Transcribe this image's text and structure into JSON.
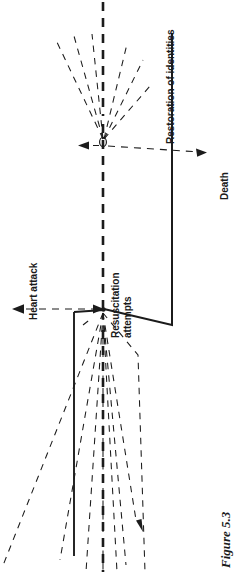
{
  "figure": {
    "caption": "Figure 5.3",
    "colors": {
      "ink": "#1b1b1b",
      "background": "#ffffff"
    },
    "orientation": "rotated-90-ccw"
  },
  "labels": {
    "heart_attack": "Heart attack",
    "resuscitation_attempts_line1": "Resuscitation",
    "resuscitation_attempts_line2": "attempts",
    "restoration_of_identities": "Restoration of identities",
    "death": "Death"
  },
  "diagram_elements": {
    "axis_dashed_bold": "bold-dashed-vertical-axis",
    "horizontal_dashed_left_arrow": "heart-attack-arrow",
    "horizontal_dashed_right_arrow": "death-arrow",
    "solid_trajectory": "restoration-of-identities-path",
    "node_upper": "resuscitation-node-upper",
    "node_lower": "resuscitation-node-lower",
    "fan_upper_count": 6,
    "fan_lower_count": 9,
    "descending_arrow": "descending-dashed-arrow"
  }
}
